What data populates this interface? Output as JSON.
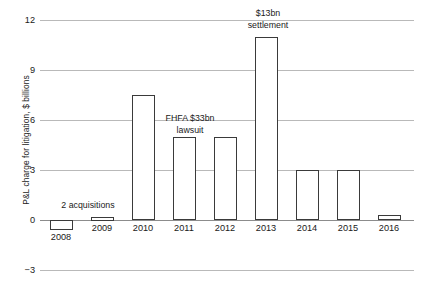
{
  "chart_data": {
    "type": "bar",
    "title": "",
    "xlabel": "",
    "ylabel": "P&L charge for litigation, $ billions",
    "categories": [
      "2008",
      "2009",
      "2010",
      "2011",
      "2012",
      "2013",
      "2014",
      "2015",
      "2016"
    ],
    "values": [
      -0.6,
      0.2,
      7.5,
      5.0,
      5.0,
      11.0,
      3.0,
      3.0,
      0.3
    ],
    "ylim": [
      -3,
      12
    ],
    "yticks": [
      12,
      9,
      6,
      3,
      0,
      -3
    ],
    "ytick_labels": [
      "12",
      "9",
      "6",
      "3",
      "0",
      "−3"
    ],
    "grid": true,
    "legend": null,
    "bar_style": {
      "fill": "#ffffff",
      "outline": "#3a3a3a"
    },
    "annotations": [
      {
        "id": "acquisitions",
        "lines": [
          "2 acquisitions"
        ],
        "anchor_category": "2008",
        "x_px": 88,
        "y_px": 200
      },
      {
        "id": "fhfa-lawsuit",
        "lines": [
          "FHFA $33bn",
          "lawsuit"
        ],
        "anchor_category": "2011",
        "x_px": 190,
        "y_px": 113
      },
      {
        "id": "settlement",
        "lines": [
          "$13bn",
          "settlement"
        ],
        "anchor_category": "2013",
        "x_px": 268,
        "y_px": 8
      }
    ]
  },
  "layout": {
    "plot_left_px": 40,
    "zero_y_px": 220,
    "px_per_unit": 16.6667,
    "bar_width_px": 23,
    "category_centers_px": [
      21,
      62,
      103,
      144,
      185,
      226,
      267,
      308,
      349
    ]
  }
}
